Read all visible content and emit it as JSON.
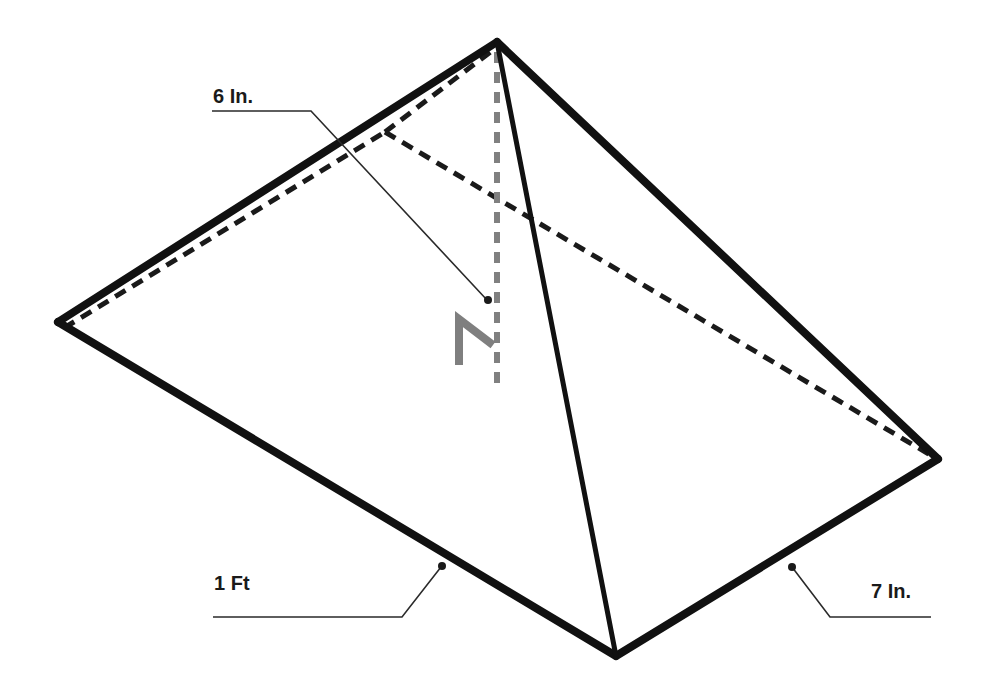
{
  "diagram": {
    "type": "rectangular pyramid",
    "colors": {
      "edge": "#111111",
      "hidden_edge": "#1a1a1a",
      "altitude": "#808080",
      "leader": "#2a2a2a",
      "background": "#ffffff"
    },
    "vertices": {
      "apex": [
        497,
        42
      ],
      "left": [
        58,
        322
      ],
      "front": [
        616,
        656
      ],
      "right": [
        938,
        459
      ],
      "back": [
        385,
        132
      ]
    },
    "labels": {
      "height": "6 In.",
      "length": "1 Ft",
      "width": "7 In."
    },
    "right_angle_marker": true
  }
}
